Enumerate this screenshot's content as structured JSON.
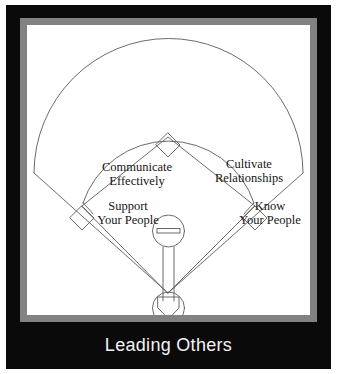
{
  "poster": {
    "title": "Leading Others",
    "colors": {
      "frame_black": "#0a0a0a",
      "frame_gray": "#828282",
      "field_white": "#ffffff",
      "line_ink": "#555555",
      "text_ink": "#151515",
      "banner_text": "#f2f2f2"
    }
  },
  "banner": {
    "label": "Leading Others"
  },
  "diagram": {
    "type": "baseball-diamond",
    "name": "leading-others-baseball-diamond",
    "labels": [
      {
        "id": "communicate",
        "line1": "Communicate",
        "line2": "Effectively",
        "quadrant": "upper-left",
        "base": "third-base-side"
      },
      {
        "id": "cultivate",
        "line1": "Cultivate",
        "line2": "Relationships",
        "quadrant": "upper-right",
        "base": "first-base-side"
      },
      {
        "id": "support",
        "line1": "Support",
        "line2": "Your People",
        "quadrant": "lower-left",
        "base": "third-base"
      },
      {
        "id": "know",
        "line1": "Know",
        "line2": "Your People",
        "quadrant": "lower-right",
        "base": "first-base"
      }
    ],
    "features": [
      "outfield-fence-arc",
      "infield-grass-arc",
      "foul-line-left",
      "foul-line-right",
      "second-base-diamond",
      "third-base-diamond",
      "first-base-diamond",
      "pitchers-mound-circle",
      "pitchers-rubber",
      "home-plate-pentagon",
      "batters-circle",
      "mound-to-home-corridor"
    ]
  }
}
